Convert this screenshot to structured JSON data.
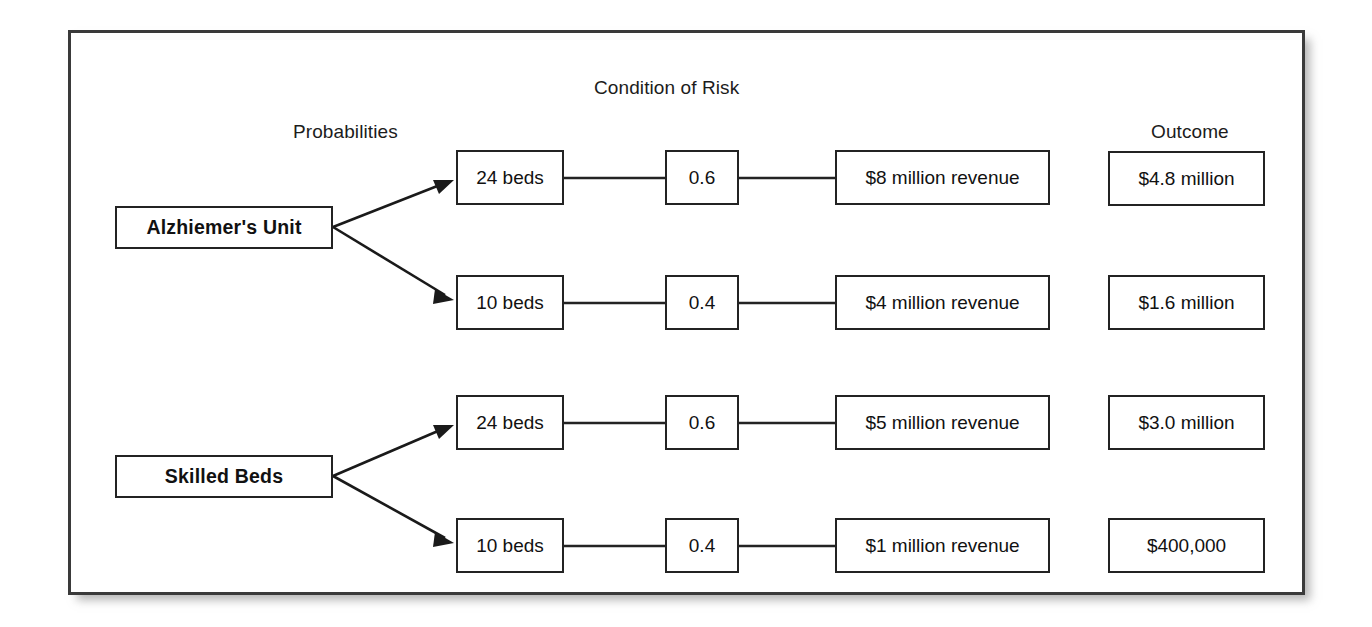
{
  "figure": {
    "headers": {
      "condition_of_risk": "Condition of Risk",
      "probabilities": "Probabilities",
      "outcome": "Outcome"
    },
    "decisions": [
      {
        "label": "Alzhiemer's Unit"
      },
      {
        "label": "Skilled Beds"
      }
    ],
    "rows": [
      {
        "decision": "Alzhiemer's Unit",
        "beds": "24 beds",
        "probability": "0.6",
        "revenue": "$8 million revenue",
        "outcome": "$4.8 million"
      },
      {
        "decision": "Alzhiemer's Unit",
        "beds": "10 beds",
        "probability": "0.4",
        "revenue": "$4 million revenue",
        "outcome": "$1.6 million"
      },
      {
        "decision": "Skilled Beds",
        "beds": "24 beds",
        "probability": "0.6",
        "revenue": "$5 million revenue",
        "outcome": "$3.0 million"
      },
      {
        "decision": "Skilled Beds",
        "beds": "10 beds",
        "probability": "0.4",
        "revenue": "$1 million revenue",
        "outcome": "$400,000"
      }
    ],
    "colors": {
      "frame_border": "#3a3a3a",
      "box_border": "#232323",
      "line": "#1a1a1a",
      "text": "#111111",
      "background": "#ffffff"
    }
  }
}
